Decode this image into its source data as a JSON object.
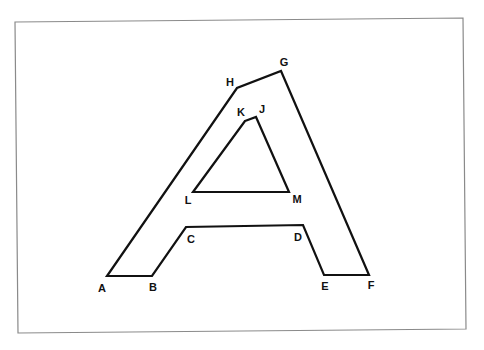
{
  "diagram": {
    "type": "labeled polygon outline of the letter A",
    "colors": {
      "background": "#ffffff",
      "frame": "#8a8a8a",
      "stroke": "#111111",
      "label": "#111111"
    },
    "frame": {
      "corners": [
        [
          15,
          22
        ],
        [
          463,
          18
        ],
        [
          466,
          329
        ],
        [
          18,
          333
        ]
      ]
    },
    "outer_polygon": {
      "name": "outer-outline",
      "vertex_order": [
        "A",
        "B",
        "C",
        "D",
        "E",
        "F",
        "G",
        "H"
      ]
    },
    "inner_polygon": {
      "name": "inner-triangle",
      "vertex_order": [
        "K",
        "J",
        "M",
        "L"
      ]
    },
    "vertices": [
      {
        "id": "A",
        "label": "A",
        "x": 107,
        "y": 276,
        "lx": 102,
        "ly": 292
      },
      {
        "id": "B",
        "label": "B",
        "x": 152,
        "y": 276,
        "lx": 153,
        "ly": 291
      },
      {
        "id": "C",
        "label": "C",
        "x": 186,
        "y": 227,
        "lx": 191,
        "ly": 243
      },
      {
        "id": "D",
        "label": "D",
        "x": 303,
        "y": 225,
        "lx": 298,
        "ly": 241
      },
      {
        "id": "E",
        "label": "E",
        "x": 324,
        "y": 275,
        "lx": 325,
        "ly": 290
      },
      {
        "id": "F",
        "label": "F",
        "x": 369,
        "y": 275,
        "lx": 371,
        "ly": 289
      },
      {
        "id": "G",
        "label": "G",
        "x": 281,
        "y": 71,
        "lx": 284,
        "ly": 66
      },
      {
        "id": "H",
        "label": "H",
        "x": 237,
        "y": 88,
        "lx": 230,
        "ly": 86
      },
      {
        "id": "J",
        "label": "J",
        "x": 256,
        "y": 117,
        "lx": 262,
        "ly": 113
      },
      {
        "id": "K",
        "label": "K",
        "x": 245,
        "y": 121,
        "lx": 241,
        "ly": 116
      },
      {
        "id": "L",
        "label": "L",
        "x": 193,
        "y": 192,
        "lx": 188,
        "ly": 204
      },
      {
        "id": "M",
        "label": "M",
        "x": 289,
        "y": 192,
        "lx": 297,
        "ly": 203
      }
    ]
  }
}
